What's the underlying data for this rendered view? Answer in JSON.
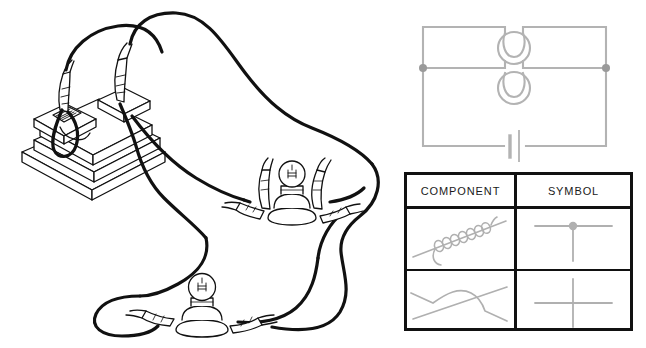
{
  "page": {
    "background_color": "#ffffff",
    "width": 646,
    "height": 348
  },
  "colors": {
    "photo_line": "#111111",
    "photo_fill": "#ffffff",
    "diagram_line": "#b3b3b3",
    "diagram_node": "#9a9a9a",
    "table_border": "#111111",
    "table_text": "#1a1a1a",
    "symbol_line": "#b0b0b0"
  },
  "photo": {
    "name": "parallel-circuit-practical-photo",
    "caption_visible": false,
    "components": [
      {
        "name": "battery-pack",
        "label": "battery pack / cell holder"
      },
      {
        "name": "crocodile-clip",
        "label": "crocodile clip"
      },
      {
        "name": "lamp-holder-upper",
        "label": "lamp in holder"
      },
      {
        "name": "lamp-holder-lower",
        "label": "lamp in holder"
      },
      {
        "name": "connecting-wire",
        "label": "connecting wire"
      }
    ]
  },
  "circuit_diagram": {
    "name": "parallel-circuit-schematic",
    "elements": [
      {
        "name": "lamp-symbol-top",
        "label": "lamp"
      },
      {
        "name": "lamp-symbol-bottom",
        "label": "lamp"
      },
      {
        "name": "battery-symbol",
        "label": "cell"
      },
      {
        "name": "junction-node-left",
        "label": "junction"
      },
      {
        "name": "junction-node-right",
        "label": "junction"
      }
    ]
  },
  "table": {
    "name": "component-symbol-table",
    "headers": {
      "component": "COMPONENT",
      "symbol": "SYMBOL"
    },
    "rows": [
      {
        "component_name": "wires-joined-photo",
        "component_label": "wires joined (coiled together)",
        "symbol_name": "wires-joined-symbol",
        "symbol_label": "junction dot"
      },
      {
        "component_name": "wires-crossing-photo",
        "component_label": "wires crossing (not joined)",
        "symbol_name": "wires-crossing-symbol",
        "symbol_label": "plain crossing"
      }
    ]
  }
}
